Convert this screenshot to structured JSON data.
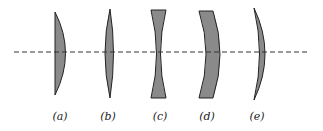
{
  "figure": {
    "colors": {
      "lens_fill": "#8a8a8a",
      "outline": "#222222",
      "axis": "#333333"
    },
    "axis": {
      "style": "dashed"
    },
    "lenses": [
      {
        "label": "(a)",
        "type": "plano-convex"
      },
      {
        "label": "(b)",
        "type": "biconvex"
      },
      {
        "label": "(c)",
        "type": "biconcave"
      },
      {
        "label": "(d)",
        "type": "meniscus (concave)"
      },
      {
        "label": "(e)",
        "type": "meniscus (convex)"
      }
    ]
  }
}
